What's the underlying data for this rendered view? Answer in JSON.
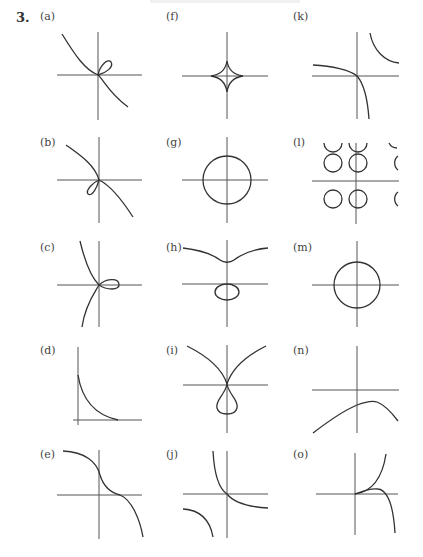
{
  "exercise_number": "3.",
  "panels": [
    {
      "id": "a",
      "label": "(a)",
      "description": "folium-like curve with loop in first quadrant, decreasing through origin"
    },
    {
      "id": "b",
      "label": "(b)",
      "description": "decreasing curve through origin with small loop in third quadrant"
    },
    {
      "id": "c",
      "label": "(c)",
      "description": "curve through origin with loop to the right along positive x-axis"
    },
    {
      "id": "d",
      "label": "(d)",
      "description": "decaying curve in first quadrant approaching x-axis"
    },
    {
      "id": "e",
      "label": "(e)",
      "description": "decreasing cubic-like curve with inflection on positive x-axis"
    },
    {
      "id": "f",
      "label": "(f)",
      "description": "astroid centered at origin"
    },
    {
      "id": "g",
      "label": "(g)",
      "description": "circle centered at origin"
    },
    {
      "id": "h",
      "label": "(h)",
      "description": "upper branch with dip above origin and oval below x-axis"
    },
    {
      "id": "i",
      "label": "(i)",
      "description": "two branches meeting at origin with teardrop loop below"
    },
    {
      "id": "j",
      "label": "(j)",
      "description": "hyperbola branches, one passing through origin"
    },
    {
      "id": "k",
      "label": "(k)",
      "description": "hyperbola-like branches, one through origin, one in first quadrant"
    },
    {
      "id": "l",
      "label": "(l)",
      "description": "periodic grid of circles"
    },
    {
      "id": "m",
      "label": "(m)",
      "description": "circle centered at origin"
    },
    {
      "id": "n",
      "label": "(n)",
      "description": "concave-down arch below x-axis"
    },
    {
      "id": "o",
      "label": "(o)",
      "description": "two curves from origin, one increasing and one turning down"
    }
  ]
}
